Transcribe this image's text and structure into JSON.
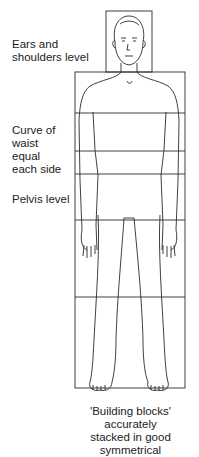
{
  "labels": {
    "ears_shoulders": [
      "Ears and",
      "shoulders level"
    ],
    "waist": [
      "Curve of",
      "waist",
      "equal",
      "each side"
    ],
    "pelvis": "Pelvis level"
  },
  "caption": [
    "'Building blocks'",
    "accurately",
    "stacked in good",
    "symmetrical"
  ],
  "colors": {
    "line": "#2a2a2a",
    "background": "#ffffff"
  }
}
